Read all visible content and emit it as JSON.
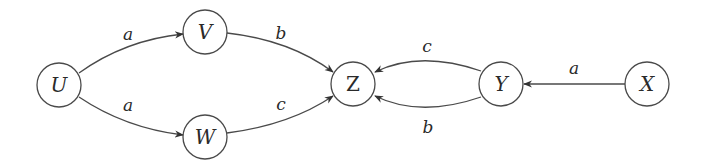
{
  "diagram": {
    "type": "directed-graph",
    "nodes": [
      {
        "id": "U",
        "label": "U"
      },
      {
        "id": "V",
        "label": "V"
      },
      {
        "id": "W",
        "label": "W"
      },
      {
        "id": "Z",
        "label": "Z"
      },
      {
        "id": "Y",
        "label": "Y"
      },
      {
        "id": "X",
        "label": "X"
      }
    ],
    "edges": [
      {
        "from": "U",
        "to": "V",
        "label": "a"
      },
      {
        "from": "U",
        "to": "W",
        "label": "a"
      },
      {
        "from": "V",
        "to": "Z",
        "label": "b"
      },
      {
        "from": "W",
        "to": "Z",
        "label": "c"
      },
      {
        "from": "Y",
        "to": "Z",
        "label": "c",
        "curve": "upper"
      },
      {
        "from": "Y",
        "to": "Z",
        "label": "b",
        "curve": "lower"
      },
      {
        "from": "X",
        "to": "Y",
        "label": "a"
      }
    ],
    "colors": {
      "stroke": "#4a4a4a",
      "text": "#2a2a2a",
      "background": "#ffffff"
    }
  }
}
